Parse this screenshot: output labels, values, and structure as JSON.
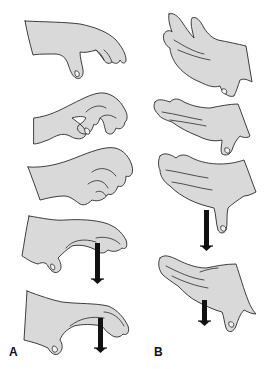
{
  "figure": {
    "panels": [
      {
        "label": "A",
        "hands": [
          {
            "id": "a1",
            "position": "fingers-flexed-relaxed",
            "arrow": false
          },
          {
            "id": "a2",
            "position": "claw-grasp",
            "arrow": false
          },
          {
            "id": "a3",
            "position": "fingers-curled",
            "arrow": false
          },
          {
            "id": "a4",
            "position": "fingers-extending-down",
            "arrow": true,
            "arrow_direction": "down"
          },
          {
            "id": "a5",
            "position": "fingers-extending-down",
            "arrow": true,
            "arrow_direction": "down"
          }
        ]
      },
      {
        "label": "B",
        "hands": [
          {
            "id": "b1",
            "position": "fingers-extended-upward",
            "arrow": false
          },
          {
            "id": "b2",
            "position": "fingers-extended",
            "arrow": false
          },
          {
            "id": "b3",
            "position": "fingers-extended-thumb-down",
            "arrow": true,
            "arrow_direction": "down"
          },
          {
            "id": "b4",
            "position": "fingers-extended-thumb-down",
            "arrow": true,
            "arrow_direction": "down"
          }
        ]
      }
    ],
    "colors": {
      "skin_fill": "#d9d9d9",
      "outline": "#2a2a2a",
      "arrow": "#111111",
      "background": "#ffffff"
    }
  }
}
